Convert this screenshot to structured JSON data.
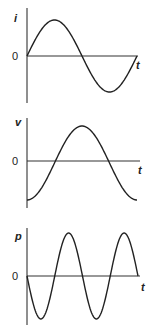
{
  "panels": [
    {
      "id": "current",
      "y_label": "i",
      "zero_label": "0",
      "x_label": "t",
      "waveform": "sine",
      "description": "current i vs time t, starts at 0 rising"
    },
    {
      "id": "voltage",
      "y_label": "v",
      "zero_label": "0",
      "x_label": "t",
      "waveform": "negative-cosine",
      "description": "voltage v vs time t, lags current by 90 degrees, starts at minimum"
    },
    {
      "id": "power",
      "y_label": "p",
      "zero_label": "0",
      "x_label": "t",
      "waveform": "negative-sine-double-frequency",
      "description": "power p = v*i vs time t, twice the frequency, starts at 0 going negative"
    }
  ],
  "chart_data": [
    {
      "type": "line",
      "title": "",
      "ylabel": "i",
      "xlabel": "t",
      "x": [
        0,
        0.25,
        0.5,
        0.75,
        1.0
      ],
      "values": [
        0,
        1,
        0,
        -1,
        0
      ]
    },
    {
      "type": "line",
      "title": "",
      "ylabel": "v",
      "xlabel": "t",
      "x": [
        0,
        0.25,
        0.5,
        0.75,
        1.0
      ],
      "values": [
        -1,
        0,
        1,
        0,
        -1
      ]
    },
    {
      "type": "line",
      "title": "",
      "ylabel": "p",
      "xlabel": "t",
      "x": [
        0,
        0.125,
        0.25,
        0.375,
        0.5,
        0.625,
        0.75,
        0.875,
        1.0
      ],
      "values": [
        0,
        -1,
        0,
        1,
        0,
        -1,
        0,
        1,
        0
      ]
    }
  ]
}
